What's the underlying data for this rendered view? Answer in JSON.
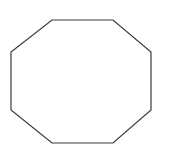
{
  "figure": {
    "name": "octagon",
    "width": 174,
    "height": 156,
    "background_color": "#ffffff"
  },
  "shape": {
    "name": "octagon",
    "label": "octagon",
    "sides": 8,
    "filled": false,
    "fill_color": "none",
    "stroke_color": "#3a3a3a",
    "stroke_width": 1.2,
    "vertices": [
      [
        52,
        20
      ],
      [
        113,
        20
      ],
      [
        151,
        52
      ],
      [
        151,
        110
      ],
      [
        113,
        143
      ],
      [
        52,
        143
      ],
      [
        11,
        110
      ],
      [
        11,
        52
      ]
    ],
    "points_string": "52,20 113,20 151,52 151,110 113,143 52,143 11,110 11,52",
    "bounding_box": {
      "x": 11,
      "y": 20,
      "width": 140,
      "height": 123
    }
  }
}
